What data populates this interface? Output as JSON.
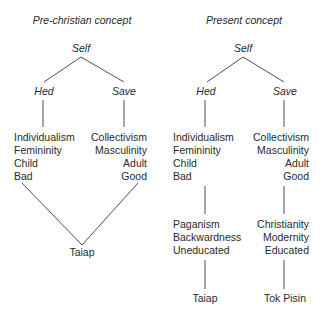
{
  "left": {
    "title": "Pre-christian concept",
    "root": "Self",
    "left_branch": "Hed",
    "right_branch": "Save",
    "left_traits": [
      "Individualism",
      "Femininity",
      "Child",
      "Bad"
    ],
    "right_traits": [
      "Collectivism",
      "Masculinity",
      "Adult",
      "Good"
    ],
    "merged_outcome": "Taiap"
  },
  "right": {
    "title": "Present concept",
    "root": "Self",
    "left_branch": "Hed",
    "right_branch": "Save",
    "left_traits": [
      "Individualism",
      "Femininity",
      "Child",
      "Bad"
    ],
    "right_traits": [
      "Collectivism",
      "Masculinity",
      "Adult",
      "Good"
    ],
    "left_associations": [
      "Paganism",
      "Backwardness",
      "Uneducated"
    ],
    "right_associations": [
      "Christianity",
      "Modernity",
      "Educated"
    ],
    "left_outcome": "Taiap",
    "right_outcome": "Tok Pisin"
  },
  "colors": {
    "line": "#3a3a3a",
    "text": "#2a2a2a",
    "background": "#ffffff"
  }
}
